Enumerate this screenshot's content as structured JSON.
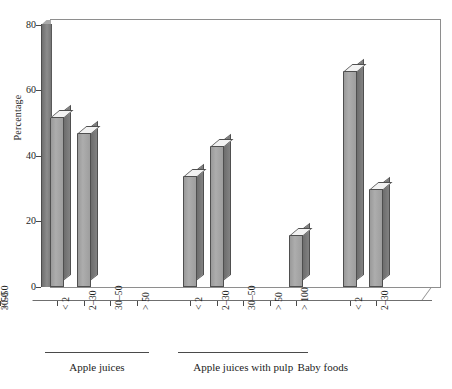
{
  "chart_data": {
    "type": "bar",
    "title": "",
    "xlabel": "",
    "ylabel": "Percentage",
    "ylim": [
      0,
      80
    ],
    "yticks": [
      0,
      20,
      40,
      60,
      80
    ],
    "grid": false,
    "legend": null,
    "style": "3d-column",
    "axis_color": "#4a4a4a",
    "bar_face_color": "#a6a6a6",
    "bar_side_color": "#757575",
    "bar_top_color": "#f2f2f2",
    "groups": [
      {
        "name": "Apple juices",
        "categories": [
          "< 2",
          "2–30",
          "30–50",
          "> 50"
        ],
        "values": [
          52,
          47,
          0,
          0
        ]
      },
      {
        "name": "Apple juices with pulp",
        "categories": [
          "< 2",
          "2–30",
          "30–50",
          "> 50",
          "> 100"
        ],
        "values": [
          34,
          43,
          0,
          0,
          16
        ]
      },
      {
        "name": "Baby foods",
        "categories": [
          "< 2",
          "2–30",
          "30–50",
          "> 50"
        ],
        "values": [
          66,
          30,
          0,
          0
        ]
      }
    ]
  }
}
